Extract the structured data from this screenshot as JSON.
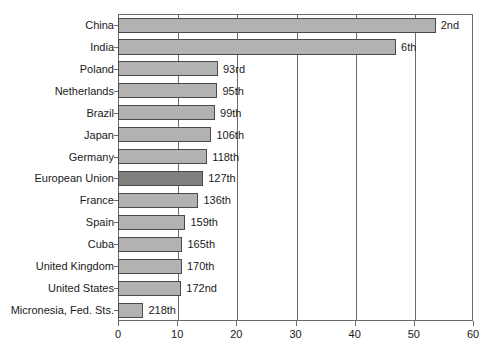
{
  "chart_data": {
    "type": "bar",
    "orientation": "horizontal",
    "title": "",
    "xlabel": "",
    "ylabel": "",
    "xlim": [
      0,
      60
    ],
    "xticks": [
      0,
      10,
      20,
      30,
      40,
      50,
      60
    ],
    "grid": true,
    "grid_axis": "x",
    "legend": "none",
    "categories": [
      "China",
      "India",
      "Poland",
      "Netherlands",
      "Brazil",
      "Japan",
      "Germany",
      "European Union",
      "France",
      "Spain",
      "Cuba",
      "United Kingdom",
      "United States",
      "Micronesia, Fed. Sts."
    ],
    "values": [
      53.7,
      47.0,
      16.9,
      16.8,
      16.4,
      15.8,
      15.1,
      14.4,
      13.6,
      11.4,
      10.9,
      10.8,
      10.7,
      4.3
    ],
    "data_labels": [
      "2nd",
      "6th",
      "93rd",
      "95th",
      "99th",
      "106th",
      "118th",
      "127th",
      "136th",
      "159th",
      "165th",
      "170th",
      "172nd",
      "218th"
    ],
    "highlight_index": 7,
    "bar_color": "#b2b2b2",
    "highlight_color": "#808080",
    "bar_border_color": "#4a4a4a",
    "axis_color": "#6b6b6b",
    "text_color": "#1a1a1a"
  }
}
